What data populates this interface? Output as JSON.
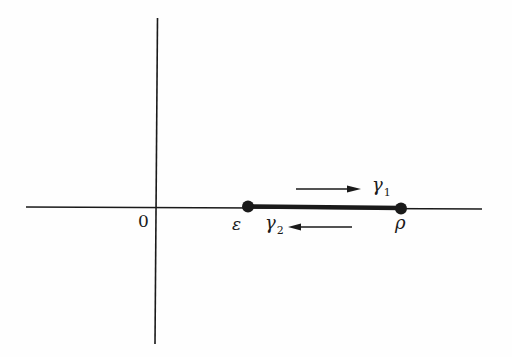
{
  "diagram": {
    "type": "complex-plane contour",
    "labels": {
      "origin": "0",
      "epsilon": "ε",
      "rho": "ρ",
      "gamma1": "γ",
      "gamma1_sub": "1",
      "gamma2": "γ",
      "gamma2_sub": "2"
    },
    "points": [
      {
        "name": "epsilon",
        "label": "ε",
        "x": 248,
        "y": 206
      },
      {
        "name": "rho",
        "label": "ρ",
        "x": 401,
        "y": 208
      }
    ],
    "paths": [
      {
        "name": "gamma1",
        "direction": "left-to-right",
        "from": "ε",
        "to": "ρ"
      },
      {
        "name": "gamma2",
        "direction": "right-to-left",
        "from": "ρ",
        "to": "ε"
      }
    ],
    "colors": {
      "ink": "#1a1a1a",
      "background": "#fefefe"
    }
  }
}
